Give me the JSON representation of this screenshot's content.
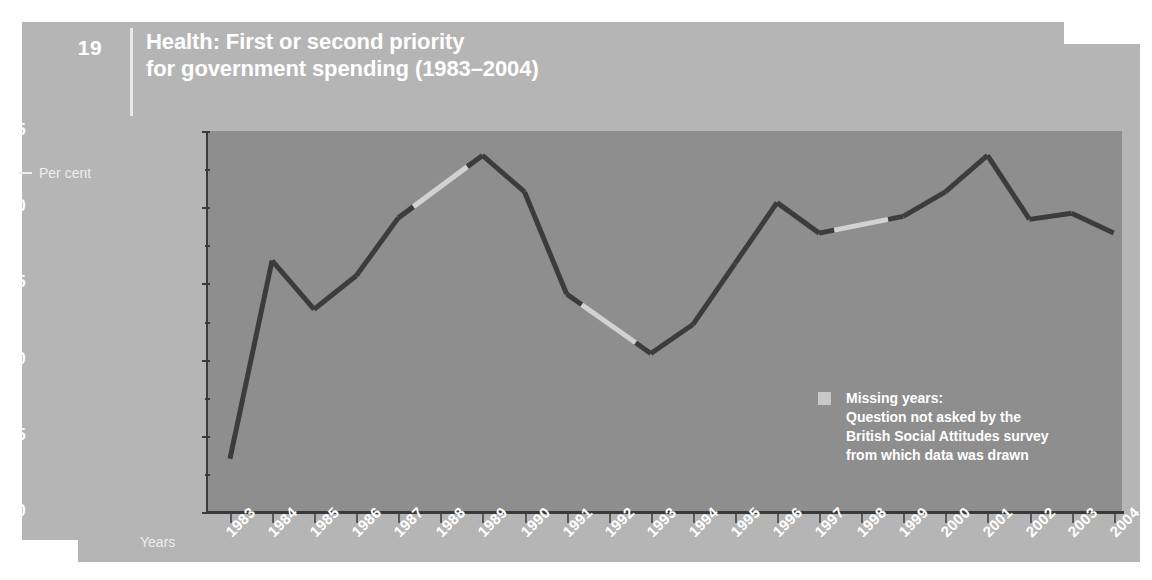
{
  "figure": {
    "number": "19",
    "title_line1": "Health: First or second priority",
    "title_line2": "for government spending (1983–2004)"
  },
  "axes": {
    "y_caption": "Per cent",
    "x_caption": "Years",
    "y_ticks": [
      "85",
      "80",
      "75",
      "70",
      "65",
      "60"
    ]
  },
  "legend": {
    "line1": "Missing years:",
    "line2": "Question not asked by the",
    "line3": "British Social Attitudes survey",
    "line4": "from which data was drawn"
  },
  "colors": {
    "panel": "#b5b5b5",
    "plot_background": "#8e8e8e",
    "line_data": "#3c3c3c",
    "line_missing": "#d2d2d2",
    "text": "#ffffff"
  },
  "chart_data": {
    "type": "line",
    "title": "Health: First or second priority for government spending (1983–2004)",
    "xlabel": "Years",
    "ylabel": "Per cent",
    "ylim": [
      60,
      85
    ],
    "ytick_step": 5,
    "grid": false,
    "legend_position": "inside-bottom-right",
    "categories": [
      "1983",
      "1984",
      "1985",
      "1986",
      "1987",
      "1988",
      "1989",
      "1990",
      "1991",
      "1992",
      "1993",
      "1994",
      "1995",
      "1996",
      "1997",
      "1998",
      "1999",
      "2000",
      "2001",
      "2002",
      "2003",
      "2004"
    ],
    "values": [
      63.5,
      76.5,
      73.3,
      75.5,
      79.3,
      null,
      83.4,
      81.0,
      74.3,
      null,
      70.4,
      72.3,
      76.3,
      80.3,
      78.3,
      null,
      79.4,
      81.0,
      83.4,
      79.2,
      79.6,
      78.3
    ],
    "missing_years": [
      "1988",
      "1992",
      "1998"
    ],
    "series": [
      {
        "name": "Health first or second priority",
        "values": [
          63.5,
          76.5,
          73.3,
          75.5,
          79.3,
          null,
          83.4,
          81.0,
          74.3,
          null,
          70.4,
          72.3,
          76.3,
          80.3,
          78.3,
          null,
          79.4,
          81.0,
          83.4,
          79.2,
          79.6,
          78.3
        ]
      }
    ]
  }
}
